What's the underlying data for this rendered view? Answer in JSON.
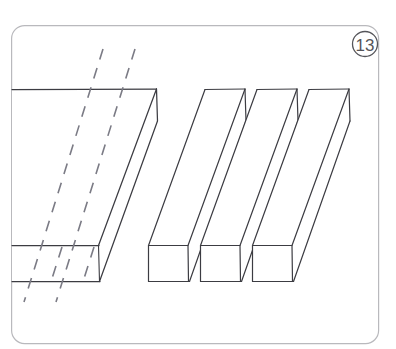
{
  "figure": {
    "step_number": "13",
    "caption": "",
    "frame": {
      "x": 11,
      "y": 25,
      "width": 368,
      "height": 319,
      "radius": 13,
      "stroke_color": "#b9b9bd",
      "stroke_width": 1.2,
      "fill_color": "#ffffff"
    },
    "badge": {
      "label": "13",
      "cx": 365,
      "cy": 44,
      "r": 12.5,
      "stroke_color": "#55555a",
      "text_color": "#55555a"
    },
    "line_color": "#3c3c42",
    "dashed_line_color": "#7b7b85",
    "background_color": "#ffffff",
    "slab": {
      "name": "uncut-slab",
      "top_face": "M 12,89 L 157,89 L 157,120 L 98,245 L 12,245 Z",
      "front_face": "M 12,245 L 98,245 L 98,281 L 12,281 Z",
      "side_face": "M 98,245 L 157,120 L 157,152 L 98,281 Z",
      "top_edge_y": 89,
      "front_top_y": 245,
      "front_bottom_y": 281,
      "right_corner_x": 157
    },
    "bars": [
      {
        "name": "bar-1",
        "face_x": 148,
        "face_y": 245,
        "face_w": 37,
        "face_h": 37,
        "top_x": 205,
        "top_w": 40,
        "top_y": 89
      },
      {
        "name": "bar-2",
        "face_x": 200,
        "face_y": 245,
        "face_w": 37,
        "face_h": 37,
        "top_x": 257,
        "top_w": 40,
        "top_y": 89
      },
      {
        "name": "bar-3",
        "face_x": 252,
        "face_y": 245,
        "face_w": 37,
        "face_h": 37,
        "top_x": 309,
        "top_w": 40,
        "top_y": 89
      }
    ],
    "cut_lines": [
      {
        "name": "cut-line-1",
        "x_top": 103,
        "y_top": 49,
        "x_bottom": 24,
        "y_bottom": 302
      },
      {
        "name": "cut-line-2",
        "x_top": 135,
        "y_top": 49,
        "x_bottom": 56,
        "y_bottom": 302
      }
    ],
    "guide_lines": [
      {
        "name": "guide-line-top",
        "x1": 12,
        "y1": 245,
        "x2": 98,
        "y2": 245
      },
      {
        "name": "guide-line-bottom",
        "x1": 12,
        "y1": 281,
        "x2": 98,
        "y2": 281
      }
    ]
  }
}
